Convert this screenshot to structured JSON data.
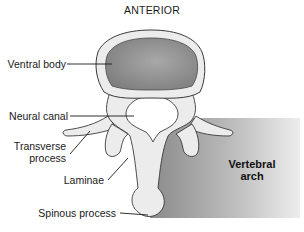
{
  "title": "ANTERIOR",
  "labels": {
    "ventral_body": "Ventral body",
    "neural_canal": "Neural canal",
    "transverse_process_line1": "Transverse",
    "transverse_process_line2": "process",
    "laminae": "Laminae",
    "spinous_process": "Spinous process"
  },
  "region": {
    "line1": "Vertebral",
    "line2": "arch"
  },
  "colors": {
    "bone_fill": "#ececec",
    "bone_outline": "#3a3a3a",
    "ventral_body_fill": "#8e8e8e",
    "region_gradient_start": "#8a8a8a",
    "region_gradient_end": "#ececec",
    "text": "#1a1a1a"
  }
}
